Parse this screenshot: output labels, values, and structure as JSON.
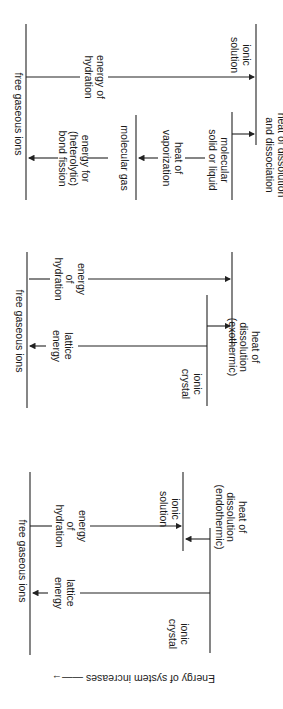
{
  "diagrams": [
    {
      "id": "dissociation",
      "levels": {
        "top": "free gaseous ions",
        "molecular_gas": "molecular gas",
        "molecular_solid": "molecular\nsolid or liquid",
        "solution": "ionic\nsolution"
      },
      "arrows": {
        "hydration": "energy of\nhydration",
        "bond_fission": "energy for\n(heterolytic)\nbond fission",
        "vaporization": "heat of\nvaporization",
        "dissolution": "heat of dissolution\nand dissociation"
      }
    },
    {
      "id": "exothermic",
      "levels": {
        "top": "free gaseous ions",
        "crystal": "ionic\ncrystal"
      },
      "arrows": {
        "hydration": "energy\nof\nhydration",
        "lattice": "lattice\nenergy",
        "dissolution": "heat of\ndissolution\n(exothermic)"
      }
    },
    {
      "id": "endothermic",
      "levels": {
        "top": "free gaseous ions",
        "solution": "ionic\nsolution",
        "crystal": "ionic\ncrystal"
      },
      "arrows": {
        "hydration": "energy\nof\nhydration",
        "lattice": "lattice\nenergy",
        "dissolution": "heat of\ndissolution\n(endothermic)"
      }
    }
  ],
  "axis_label": "Energy of system increases ——→"
}
